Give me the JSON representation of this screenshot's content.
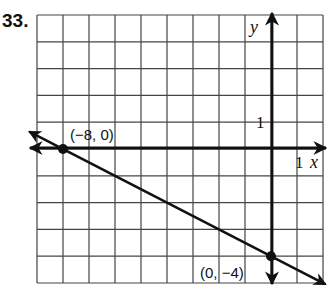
{
  "problem": {
    "number": "33."
  },
  "chart_data": {
    "type": "line",
    "title": "",
    "xlabel": "x",
    "ylabel": "y",
    "xlim": [
      -9,
      2
    ],
    "ylim": [
      -5,
      5
    ],
    "grid": true,
    "tick_labels": {
      "x": "1",
      "y": "1"
    },
    "series": [
      {
        "name": "line",
        "equation": "y = -x/2 - 4",
        "x": [
          -9,
          2
        ],
        "y": [
          0.5,
          -5
        ]
      }
    ],
    "points": [
      {
        "x": -8,
        "y": 0,
        "label": "(−8, 0)"
      },
      {
        "x": 0,
        "y": -4,
        "label": "(0, −4)"
      }
    ]
  }
}
